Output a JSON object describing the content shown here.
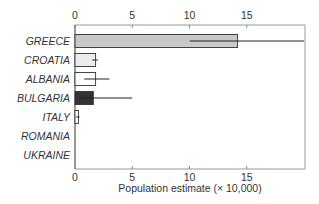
{
  "chart_data": {
    "type": "bar",
    "orientation": "horizontal",
    "title": "",
    "xlabel": "Population estimate (× 10,000)",
    "ylabel": "",
    "xlim": [
      0,
      20
    ],
    "xticks": [
      0,
      5,
      10,
      15
    ],
    "xtick_labels": [
      "0",
      "5",
      "10",
      "15"
    ],
    "ticks_top_and_bottom": true,
    "grid": false,
    "legend": null,
    "categories": [
      "GREECE",
      "CROATIA",
      "ALBANIA",
      "BULGARIA",
      "ITALY",
      "ROMANIA",
      "UKRAINE"
    ],
    "values": [
      14.2,
      1.8,
      1.8,
      1.6,
      0.3,
      0.0,
      0.0
    ],
    "error_low": [
      10.0,
      1.5,
      0.8,
      0.5,
      0.1,
      0.0,
      0.0
    ],
    "error_high": [
      20.0,
      2.0,
      3.0,
      5.0,
      0.4,
      0.0,
      0.0
    ],
    "bar_colors": [
      "#c8c8c8",
      "#ececec",
      "#ffffff",
      "#333333",
      "#ffffff",
      "#ffffff",
      "#ffffff"
    ]
  }
}
